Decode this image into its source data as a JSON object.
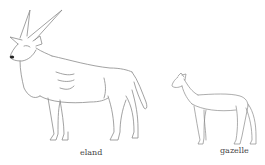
{
  "figure": {
    "animals": [
      {
        "name": "eland",
        "label": "eland"
      },
      {
        "name": "gazelle",
        "label": "gazelle"
      }
    ],
    "line_color": "#7a7a7a",
    "nose_color": "#222222"
  }
}
